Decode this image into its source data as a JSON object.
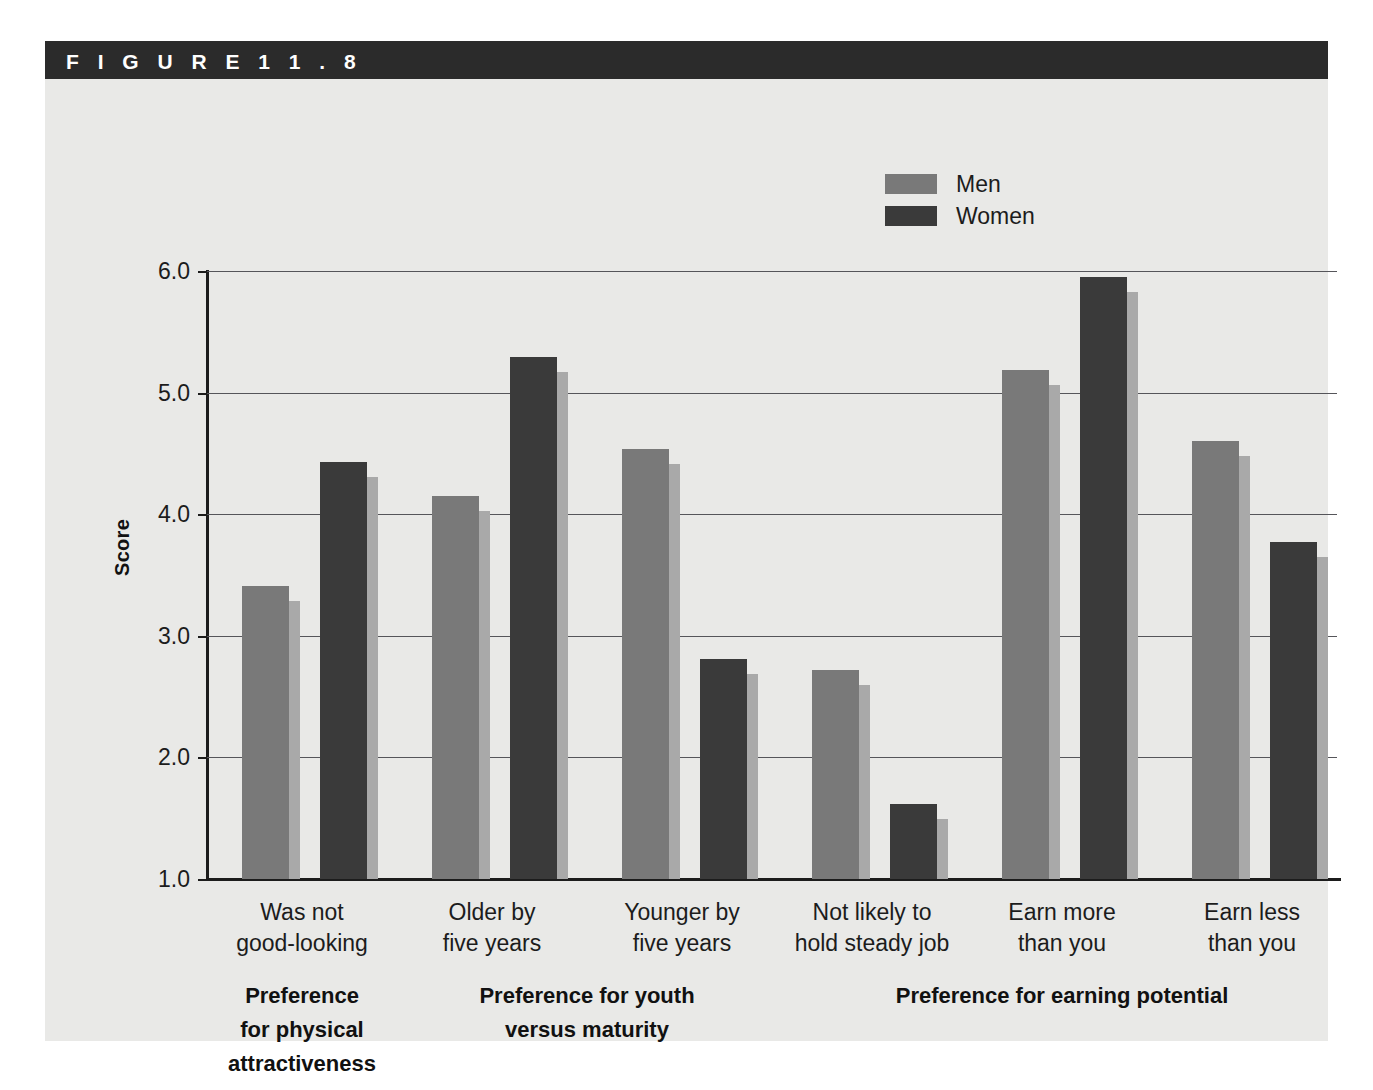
{
  "figure": {
    "label": "F I G U R E   1 1 . 8"
  },
  "legend": {
    "position": "top-right",
    "entries": [
      {
        "name": "Men",
        "color": "#797979"
      },
      {
        "name": "Women",
        "color": "#3a3a3a"
      }
    ]
  },
  "axes": {
    "ylabel": "Score",
    "yticks": [
      "1.0",
      "2.0",
      "3.0",
      "4.0",
      "5.0",
      "6.0"
    ],
    "ylim": [
      1.0,
      6.0
    ]
  },
  "groups": [
    {
      "header": "Preference\nfor physical\nattractiveness",
      "span": [
        0,
        1
      ]
    },
    {
      "header": "Preference for youth\nversus maturity",
      "span": [
        1,
        3
      ]
    },
    {
      "header": "Preference for earning potential",
      "span": [
        3,
        6
      ]
    }
  ],
  "chart_data": {
    "type": "bar",
    "title": "F I G U R E   1 1 . 8",
    "xlabel": "",
    "ylabel": "Score",
    "ylim": [
      1.0,
      6.0
    ],
    "grid": true,
    "legend_position": "top-right",
    "categories": [
      "Was not\ngood-looking",
      "Older by\nfive years",
      "Younger by\nfive years",
      "Not likely to\nhold steady job",
      "Earn more\nthan you",
      "Earn less\nthan you"
    ],
    "series": [
      {
        "name": "Men",
        "color": "#797979",
        "values": [
          3.41,
          4.15,
          4.54,
          2.72,
          5.19,
          4.6
        ]
      },
      {
        "name": "Women",
        "color": "#3a3a3a",
        "values": [
          4.43,
          5.29,
          2.81,
          1.62,
          5.95,
          3.77
        ]
      }
    ],
    "group_headers": [
      "Preference for physical attractiveness",
      "Preference for youth versus maturity",
      "Preference for earning potential"
    ]
  }
}
